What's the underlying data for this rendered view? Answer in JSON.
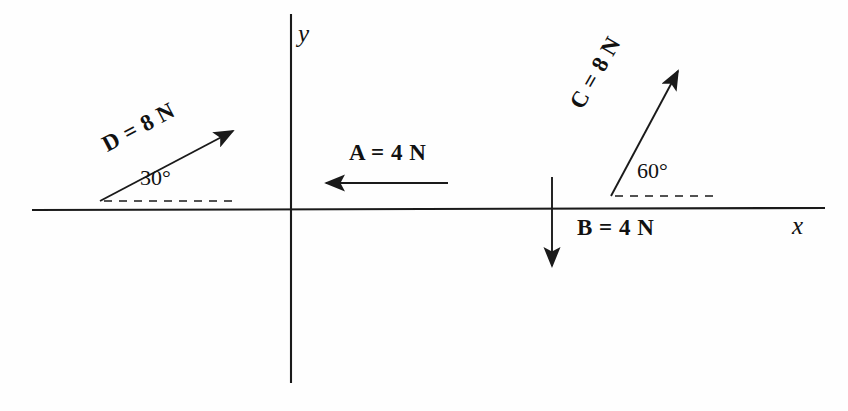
{
  "figure": {
    "type": "vector-force-diagram",
    "background_color": "#fefefe",
    "stroke_color": "#1a1a1a",
    "axes": {
      "x_label": "x",
      "y_label": "y",
      "origin": [
        290,
        210
      ],
      "x_axis_extent": [
        32,
        825
      ],
      "y_axis_extent": [
        14,
        383
      ]
    },
    "vectors": [
      {
        "id": "A",
        "label": "A = 4 N",
        "magnitude": 4,
        "unit": "N",
        "direction_deg": 180,
        "angle_label": null,
        "tail": [
          448,
          183
        ],
        "head": [
          322,
          183
        ],
        "has_dashed_reference": false
      },
      {
        "id": "B",
        "label": "B = 4 N",
        "magnitude": 4,
        "unit": "N",
        "direction_deg": 270,
        "angle_label": null,
        "tail": [
          552,
          177
        ],
        "head": [
          552,
          272
        ],
        "has_dashed_reference": false
      },
      {
        "id": "C",
        "label": "C = 8 N",
        "magnitude": 8,
        "unit": "N",
        "direction_deg": 60,
        "angle_label": "60°",
        "tail": [
          611,
          196
        ],
        "head": [
          682,
          64
        ],
        "has_dashed_reference": true,
        "dashed_reference": [
          [
            615,
            196
          ],
          [
            716,
            196
          ]
        ]
      },
      {
        "id": "D",
        "label": "D = 8 N",
        "magnitude": 8,
        "unit": "N",
        "direction_deg": 30,
        "angle_label": "30°",
        "tail": [
          100,
          201
        ],
        "head": [
          238,
          128
        ],
        "has_dashed_reference": true,
        "dashed_reference": [
          [
            104,
            201
          ],
          [
            232,
            201
          ]
        ]
      }
    ]
  }
}
